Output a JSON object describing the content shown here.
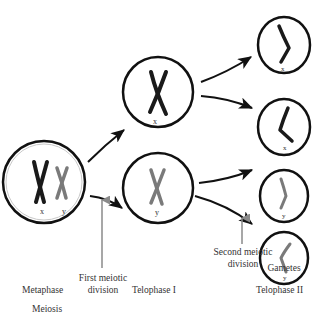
{
  "diagram": {
    "title": "Meiosis",
    "stages": [
      {
        "label": "Metaphase"
      },
      {
        "label": "Telophase I"
      },
      {
        "label": "Telophase II"
      }
    ],
    "annotations": {
      "first_division": "First meiotic\ndivision",
      "first_division_line1": "First meiotic",
      "first_division_line2": "division",
      "second_division_line1": "Second meiotic",
      "second_division_line2": "division",
      "gametes": "Gametes"
    },
    "cells": {
      "metaphase": {
        "chromosomes": [
          "x",
          "y"
        ]
      },
      "telophase1_top": {
        "chromosome": "x"
      },
      "telophase1_bottom": {
        "chromosome": "y"
      },
      "gametes": [
        "x",
        "x",
        "y",
        "y"
      ]
    },
    "colors": {
      "x_chromosome": "#1a1a1a",
      "y_chromosome": "#7a7a7a",
      "division_arrow": "#8a8a8a",
      "cell_outline": "#111111"
    }
  }
}
